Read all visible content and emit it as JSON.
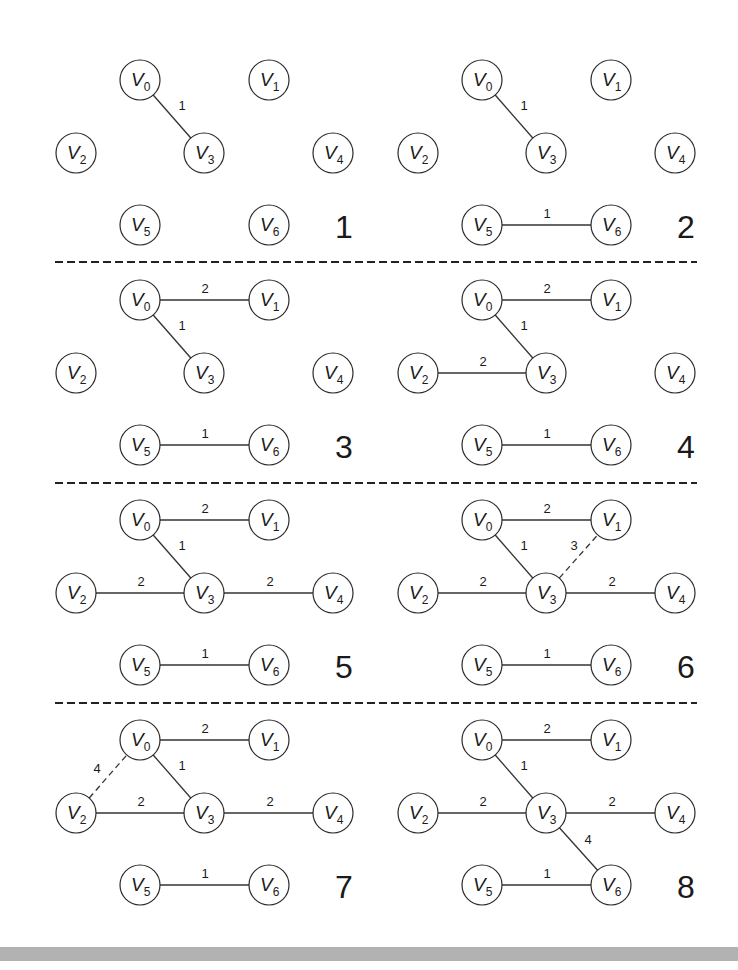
{
  "diagram": {
    "title": "",
    "node_radius": 20,
    "node_label_prefix": "V",
    "panel_layout": {
      "columns": [
        0,
        342
      ],
      "rows": [
        0,
        220,
        440,
        660
      ]
    },
    "base_positions": {
      "V0": [
        140,
        80
      ],
      "V1": [
        269,
        80
      ],
      "V2": [
        76,
        153
      ],
      "V3": [
        204,
        153
      ],
      "V4": [
        333,
        153
      ],
      "V5": [
        140,
        225
      ],
      "V6": [
        269,
        225
      ]
    },
    "separators": [
      {
        "y": 262,
        "x1": 55,
        "x2": 697
      },
      {
        "y": 483,
        "x1": 55,
        "x2": 697
      },
      {
        "y": 703,
        "x1": 55,
        "x2": 697
      }
    ],
    "panels": [
      {
        "step": "1",
        "col": 0,
        "row": 0,
        "edges": [
          {
            "from": "V0",
            "to": "V3",
            "weight": "1",
            "style": "solid",
            "label_pos": [
              182,
              110
            ]
          }
        ]
      },
      {
        "step": "2",
        "col": 1,
        "row": 0,
        "edges": [
          {
            "from": "V0",
            "to": "V3",
            "weight": "1",
            "style": "solid",
            "label_pos": [
              182,
              110
            ]
          },
          {
            "from": "V5",
            "to": "V6",
            "weight": "1",
            "style": "solid",
            "label_pos": [
              205,
              218
            ]
          }
        ]
      },
      {
        "step": "3",
        "col": 0,
        "row": 1,
        "edges": [
          {
            "from": "V0",
            "to": "V1",
            "weight": "2",
            "style": "solid",
            "label_pos": [
              205,
              73
            ]
          },
          {
            "from": "V0",
            "to": "V3",
            "weight": "1",
            "style": "solid",
            "label_pos": [
              182,
              110
            ]
          },
          {
            "from": "V5",
            "to": "V6",
            "weight": "1",
            "style": "solid",
            "label_pos": [
              205,
              218
            ]
          }
        ]
      },
      {
        "step": "4",
        "col": 1,
        "row": 1,
        "edges": [
          {
            "from": "V0",
            "to": "V1",
            "weight": "2",
            "style": "solid",
            "label_pos": [
              205,
              73
            ]
          },
          {
            "from": "V0",
            "to": "V3",
            "weight": "1",
            "style": "solid",
            "label_pos": [
              182,
              110
            ]
          },
          {
            "from": "V2",
            "to": "V3",
            "weight": "2",
            "style": "solid",
            "label_pos": [
              141,
              146
            ]
          },
          {
            "from": "V5",
            "to": "V6",
            "weight": "1",
            "style": "solid",
            "label_pos": [
              205,
              218
            ]
          }
        ]
      },
      {
        "step": "5",
        "col": 0,
        "row": 2,
        "edges": [
          {
            "from": "V0",
            "to": "V1",
            "weight": "2",
            "style": "solid",
            "label_pos": [
              205,
              73
            ]
          },
          {
            "from": "V0",
            "to": "V3",
            "weight": "1",
            "style": "solid",
            "label_pos": [
              182,
              110
            ]
          },
          {
            "from": "V2",
            "to": "V3",
            "weight": "2",
            "style": "solid",
            "label_pos": [
              141,
              146
            ]
          },
          {
            "from": "V3",
            "to": "V4",
            "weight": "2",
            "style": "solid",
            "label_pos": [
              270,
              146
            ]
          },
          {
            "from": "V5",
            "to": "V6",
            "weight": "1",
            "style": "solid",
            "label_pos": [
              205,
              218
            ]
          }
        ]
      },
      {
        "step": "6",
        "col": 1,
        "row": 2,
        "edges": [
          {
            "from": "V0",
            "to": "V1",
            "weight": "2",
            "style": "solid",
            "label_pos": [
              205,
              73
            ]
          },
          {
            "from": "V0",
            "to": "V3",
            "weight": "1",
            "style": "solid",
            "label_pos": [
              182,
              110
            ]
          },
          {
            "from": "V3",
            "to": "V1",
            "weight": "3",
            "style": "dashed",
            "label_pos": [
              232,
              110
            ]
          },
          {
            "from": "V2",
            "to": "V3",
            "weight": "2",
            "style": "solid",
            "label_pos": [
              141,
              146
            ]
          },
          {
            "from": "V3",
            "to": "V4",
            "weight": "2",
            "style": "solid",
            "label_pos": [
              270,
              146
            ]
          },
          {
            "from": "V5",
            "to": "V6",
            "weight": "1",
            "style": "solid",
            "label_pos": [
              205,
              218
            ]
          }
        ]
      },
      {
        "step": "7",
        "col": 0,
        "row": 3,
        "edges": [
          {
            "from": "V0",
            "to": "V1",
            "weight": "2",
            "style": "solid",
            "label_pos": [
              205,
              73
            ]
          },
          {
            "from": "V0",
            "to": "V3",
            "weight": "1",
            "style": "solid",
            "label_pos": [
              182,
              110
            ]
          },
          {
            "from": "V2",
            "to": "V0",
            "weight": "4",
            "style": "dashed",
            "label_pos": [
              97,
              113
            ]
          },
          {
            "from": "V2",
            "to": "V3",
            "weight": "2",
            "style": "solid",
            "label_pos": [
              141,
              146
            ]
          },
          {
            "from": "V3",
            "to": "V4",
            "weight": "2",
            "style": "solid",
            "label_pos": [
              270,
              146
            ]
          },
          {
            "from": "V5",
            "to": "V6",
            "weight": "1",
            "style": "solid",
            "label_pos": [
              205,
              218
            ]
          }
        ]
      },
      {
        "step": "8",
        "col": 1,
        "row": 3,
        "edges": [
          {
            "from": "V0",
            "to": "V1",
            "weight": "2",
            "style": "solid",
            "label_pos": [
              205,
              73
            ]
          },
          {
            "from": "V0",
            "to": "V3",
            "weight": "1",
            "style": "solid",
            "label_pos": [
              182,
              110
            ]
          },
          {
            "from": "V2",
            "to": "V3",
            "weight": "2",
            "style": "solid",
            "label_pos": [
              141,
              146
            ]
          },
          {
            "from": "V3",
            "to": "V4",
            "weight": "2",
            "style": "solid",
            "label_pos": [
              270,
              146
            ]
          },
          {
            "from": "V3",
            "to": "V6",
            "weight": "4",
            "style": "solid",
            "label_pos": [
              246,
              184
            ]
          },
          {
            "from": "V5",
            "to": "V6",
            "weight": "1",
            "style": "solid",
            "label_pos": [
              205,
              218
            ]
          }
        ]
      }
    ],
    "step_label_pos": [
      344,
      238
    ],
    "colors": {
      "stroke": "#2a2a2a",
      "text": "#1a1a1a",
      "background": "#ffffff",
      "bottom_bar": "#b2b2b2"
    }
  }
}
